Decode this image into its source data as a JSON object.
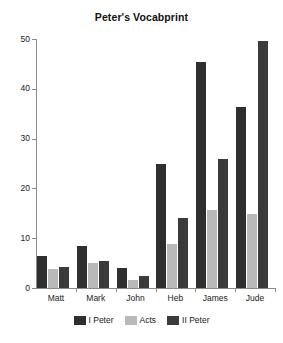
{
  "chart_data": {
    "type": "bar",
    "title": "Peter's Vocabprint",
    "xlabel": "",
    "ylabel": "",
    "categories": [
      "Matt",
      "Mark",
      "John",
      "Heb",
      "James",
      "Jude"
    ],
    "series": [
      {
        "name": "I Peter",
        "color": "#2f2f2f",
        "values": [
          6.5,
          8.5,
          4.1,
          25.0,
          45.4,
          36.4
        ]
      },
      {
        "name": "Acts",
        "color": "#b9b9b9",
        "values": [
          3.9,
          5.0,
          1.7,
          8.8,
          15.6,
          14.8
        ]
      },
      {
        "name": "II Peter",
        "color": "#3b3b3b",
        "values": [
          4.2,
          5.4,
          2.4,
          14.1,
          26.0,
          49.6
        ]
      }
    ],
    "ylim": [
      0,
      50
    ],
    "yticks": [
      0,
      10,
      20,
      30,
      40,
      50
    ],
    "ytick_labels": [
      "0",
      "10",
      "20",
      "30",
      "40",
      "50"
    ],
    "grid": false,
    "legend_position": "bottom"
  }
}
